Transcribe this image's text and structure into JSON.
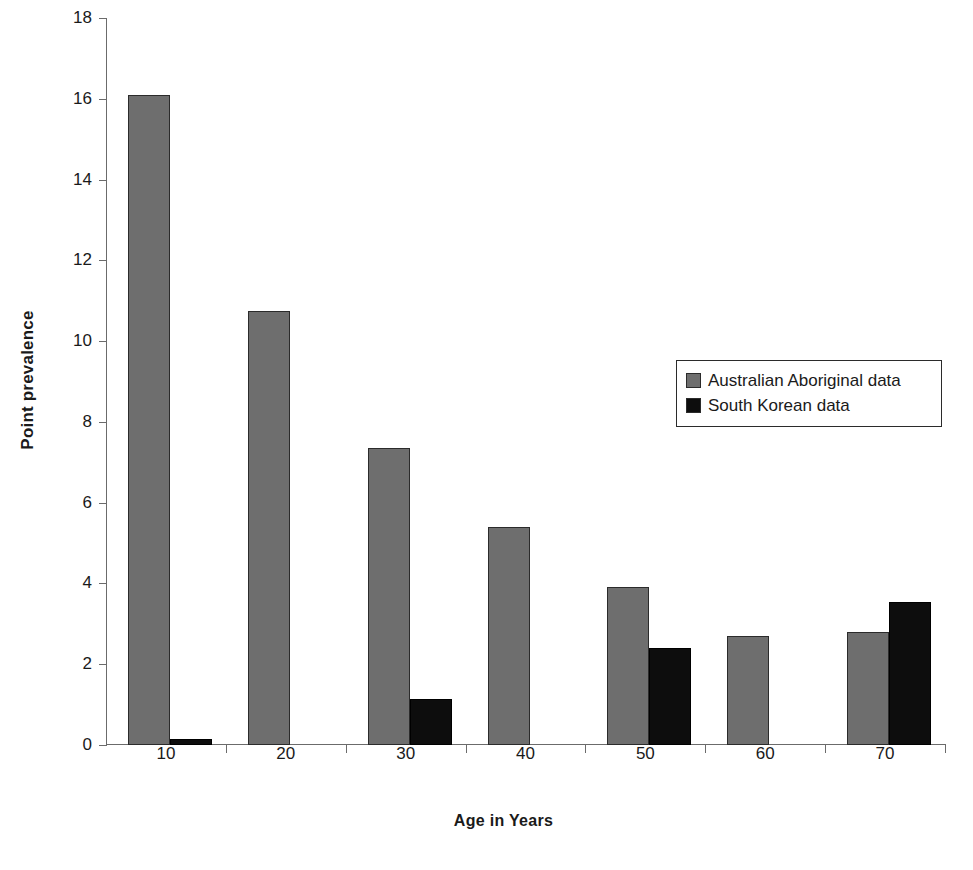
{
  "chart_data": {
    "type": "bar",
    "title": "",
    "xlabel": "Age in Years",
    "ylabel": "Point prevalence",
    "categories": [
      "10",
      "20",
      "30",
      "40",
      "50",
      "60",
      "70"
    ],
    "series": [
      {
        "name": "Australian Aboriginal data",
        "color": "#6e6e6e",
        "values": [
          16.1,
          10.75,
          7.35,
          5.4,
          3.9,
          2.7,
          2.8
        ]
      },
      {
        "name": "South Korean data",
        "color": "#0d0d0d",
        "values": [
          0.15,
          0,
          1.15,
          0,
          2.4,
          0,
          3.55
        ]
      }
    ],
    "ylim": [
      0,
      18
    ],
    "yticks": [
      0,
      2,
      4,
      6,
      8,
      10,
      12,
      14,
      16,
      18
    ],
    "ytick_labels": [
      "0",
      "2",
      "4",
      "6",
      "8",
      "10",
      "12",
      "14",
      "16",
      "18"
    ],
    "grid": false,
    "legend_position": "upper-right"
  },
  "legend": {
    "entries": [
      {
        "label": "Australian Aboriginal data",
        "color": "#6e6e6e"
      },
      {
        "label": "South Korean data",
        "color": "#0d0d0d"
      }
    ]
  },
  "colors": {
    "background": "#ffffff",
    "axis": "#6b6b6b",
    "text": "#1a1a1a",
    "series_gray": "#6e6e6e",
    "series_black": "#0d0d0d"
  }
}
